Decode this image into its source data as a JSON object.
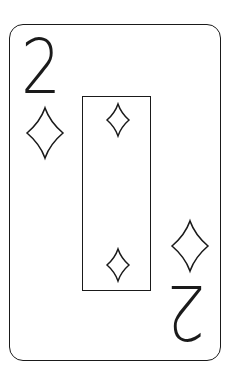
{
  "card": {
    "rank": "2",
    "suit": "diamonds",
    "corner_rank_top": "2",
    "corner_rank_bottom": "2",
    "ink_color": "#1a1a1a",
    "background_color": "#ffffff",
    "pips": [
      {
        "position": "top-center",
        "icon": "diamond-icon"
      },
      {
        "position": "bottom-center",
        "icon": "diamond-icon"
      }
    ],
    "corner_icons": [
      {
        "position": "top-left",
        "icon": "diamond-icon"
      },
      {
        "position": "bottom-right",
        "icon": "diamond-icon"
      }
    ]
  }
}
